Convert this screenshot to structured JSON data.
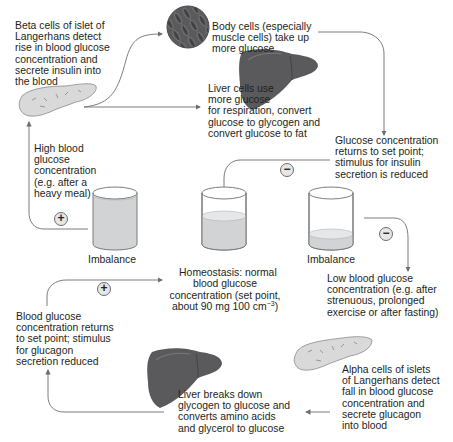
{
  "diagram": {
    "labels": {
      "beta_cells": "Beta cells of islet of\nLangerhans detect\nrise in blood glucose\nconcentration and\nsecrete insulin into\nthe blood",
      "body_cells": "Body cells (especially\nmuscle cells) take up\nmore glucose",
      "liver_use": "Liver cells use\nmore glucose\nfor respiration, convert\nglucose to glycogen and\nconvert glucose to fat",
      "returns_insulin": "Glucose concentration\nreturns to set point;\nstimulus for insulin\nsecretion is reduced",
      "high_glucose": "High blood\nglucose\nconcentration\n(e.g. after a\nheavy meal)",
      "imbalance_high": "Imbalance",
      "homeostasis_line1": "Homeostasis: normal\nblood glucose\nconcentration (set point,",
      "homeostasis_line2_prefix": "about 90 mg 100 cm",
      "homeostasis_line2_sup": "−3",
      "homeostasis_line2_suffix": ")",
      "imbalance_low": "Imbalance",
      "low_glucose": "Low blood glucose\nconcentration (e.g. after\nstrenuous, prolonged\nexercise or after fasting)",
      "returns_glucagon": "Blood glucose\nconcentration returns\nto set point; stimulus\nfor glucagon\nsecretion reduced",
      "alpha_cells": "Alpha cells of islets\nof Langerhans detect\nfall in blood glucose\nconcentration and\nsecrete glucagon\ninto blood",
      "liver_breaks": "Liver breaks down\nglycogen to glucose and\nconverts amino acids\nand glycerol to glucose"
    },
    "signs": {
      "high_plus": "+",
      "insulin_minus": "−",
      "low_minus": "−",
      "glucagon_plus": "+"
    },
    "colors": {
      "arrow": "#6d6e71",
      "liver": "#5a5a5c",
      "liquid": "#d1d3d4",
      "pancreas": "#d9d9d9",
      "sign_fill": "#e6e6e6"
    }
  }
}
